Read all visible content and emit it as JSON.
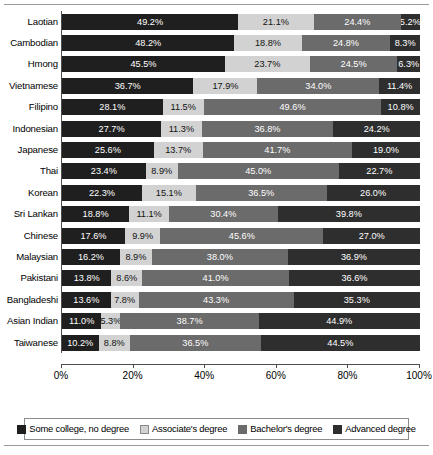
{
  "chart_data": {
    "type": "bar",
    "orientation": "horizontal",
    "stacked": true,
    "normalized_percent": true,
    "title": "",
    "subtitle": "",
    "xlabel": "",
    "ylabel": "",
    "xlim": [
      0,
      100
    ],
    "grid": false,
    "legend_position": "bottom",
    "tick_labels": [
      "0%",
      "20%",
      "40%",
      "60%",
      "80%",
      "100%"
    ],
    "tick_values": [
      0,
      20,
      40,
      60,
      80,
      100
    ],
    "categories": [
      "Laotian",
      "Cambodian",
      "Hmong",
      "Vietnamese",
      "Filipino",
      "Indonesian",
      "Japanese",
      "Thai",
      "Korean",
      "Sri Lankan",
      "Chinese",
      "Malaysian",
      "Pakistani",
      "Bangladeshi",
      "Asian Indian",
      "Taiwanese"
    ],
    "series": [
      {
        "name": "Some college, no degree",
        "color": "#1f1f1f",
        "values": [
          49.2,
          48.2,
          45.5,
          36.7,
          28.1,
          27.7,
          25.6,
          23.4,
          22.3,
          18.8,
          17.6,
          16.2,
          13.8,
          13.6,
          11.0,
          10.2
        ],
        "labels": [
          "49.2%",
          "48.2%",
          "45.5%",
          "36.7%",
          "28.1%",
          "27.7%",
          "25.6%",
          "23.4%",
          "22.3%",
          "18.8%",
          "17.6%",
          "16.2%",
          "13.8%",
          "13.6%",
          "11.0%",
          "10.2%"
        ]
      },
      {
        "name": "Associate's degree",
        "color": "#d2d2d2",
        "values": [
          21.1,
          18.8,
          23.7,
          17.9,
          11.5,
          11.3,
          13.7,
          8.9,
          15.1,
          11.1,
          9.9,
          8.9,
          8.6,
          7.8,
          5.3,
          8.8
        ],
        "labels": [
          "21.1%",
          "18.8%",
          "23.7%",
          "17.9%",
          "11.5%",
          "11.3%",
          "13.7%",
          "8.9%",
          "15.1%",
          "11.1%",
          "9.9%",
          "8.9%",
          "8.6%",
          "7.8%",
          "5.3%",
          "8.8%"
        ]
      },
      {
        "name": "Bachelor's degree",
        "color": "#6b6b6b",
        "values": [
          24.4,
          24.8,
          24.5,
          34.0,
          49.6,
          36.8,
          41.7,
          45.0,
          36.5,
          30.4,
          45.6,
          38.0,
          41.0,
          43.3,
          38.7,
          36.5
        ],
        "labels": [
          "24.4%",
          "24.8%",
          "24.5%",
          "34.0%",
          "49.6%",
          "36.8%",
          "41.7%",
          "45.0%",
          "36.5%",
          "30.4%",
          "45.6%",
          "38.0%",
          "41.0%",
          "43.3%",
          "38.7%",
          "36.5%"
        ]
      },
      {
        "name": "Advanced degree",
        "color": "#2e2e2e",
        "values": [
          5.2,
          8.3,
          6.3,
          11.4,
          10.8,
          24.2,
          19.0,
          22.7,
          26.0,
          39.8,
          27.0,
          36.9,
          36.6,
          35.3,
          44.9,
          44.5
        ],
        "labels": [
          "5.2%",
          "8.3%",
          "6.3%",
          "11.4%",
          "10.8%",
          "24.2%",
          "19.0%",
          "22.7%",
          "26.0%",
          "39.8%",
          "27.0%",
          "36.9%",
          "36.6%",
          "35.3%",
          "44.9%",
          "44.5%"
        ]
      }
    ]
  },
  "legend": {
    "items": [
      {
        "label": "Some college, no degree",
        "swatch": "s1"
      },
      {
        "label": "Associate's degree",
        "swatch": "s2"
      },
      {
        "label": "Bachelor's degree",
        "swatch": "s3"
      },
      {
        "label": "Advanced degree",
        "swatch": "s4"
      }
    ]
  }
}
